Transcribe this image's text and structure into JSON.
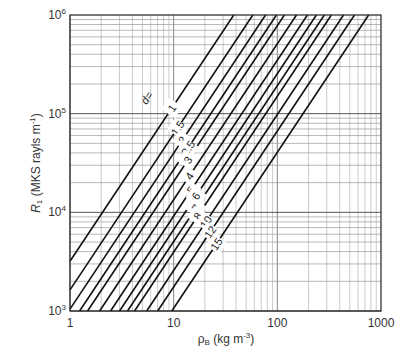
{
  "chart_data": {
    "type": "line",
    "title": "",
    "xlabel": "ρB (kg m-3)",
    "ylabel": "R1 (MKS rayls m-1)",
    "xscale": "log",
    "yscale": "log",
    "xlim": [
      1,
      1000
    ],
    "ylim": [
      1000,
      1000000
    ],
    "grid": true,
    "legend": "inline labels along lines",
    "x_ticks": [
      "1",
      "10",
      "100",
      "1000"
    ],
    "y_ticks": [
      "10^3",
      "10^4",
      "10^5",
      "10^6"
    ],
    "parameter_label": "d=",
    "series": [
      {
        "name": "1",
        "R_at_rho_1": 3000,
        "rho_at_R_1e6": 38
      },
      {
        "name": "1.5",
        "R_at_rho_1": 1300,
        "rho_at_R_1e6": 58
      },
      {
        "name": "2",
        "R_at_rho_1": 800,
        "rho_at_R_1e6": 77
      },
      {
        "name": "2.5",
        "R_at_rho_1": 550,
        "rho_at_R_1e6": 98
      },
      {
        "name": "3",
        "R_at_rho_1": 420,
        "rho_at_R_1e6": 117
      },
      {
        "name": "4",
        "R_at_rho_1": 280,
        "rho_at_R_1e6": 153
      },
      {
        "name": "5",
        "R_at_rho_1": 195,
        "rho_at_R_1e6": 195
      },
      {
        "name": "6",
        "R_at_rho_1": 140,
        "rho_at_R_1e6": 238
      },
      {
        "name": "7",
        "R_at_rho_1": 110,
        "rho_at_R_1e6": 284
      },
      {
        "name": "8",
        "R_at_rho_1": 85,
        "rho_at_R_1e6": 332
      },
      {
        "name": "10",
        "R_at_rho_1": 60,
        "rho_at_R_1e6": 435
      },
      {
        "name": "12",
        "R_at_rho_1": 43,
        "rho_at_R_1e6": 555
      },
      {
        "name": "15",
        "R_at_rho_1": 28,
        "rho_at_R_1e6": 760
      }
    ],
    "slope_loglog": 1.58
  },
  "labels": {
    "x_axis": "ρ",
    "x_axis_sub": "B",
    "x_axis_unit": " (kg m",
    "x_axis_exp": "-3",
    "x_axis_close": ")",
    "y_axis_main": "R",
    "y_axis_sub": "1",
    "y_axis_unit": " (MKS rayls m",
    "y_axis_exp": "-1",
    "y_axis_close": ")",
    "d_prefix": "d="
  }
}
